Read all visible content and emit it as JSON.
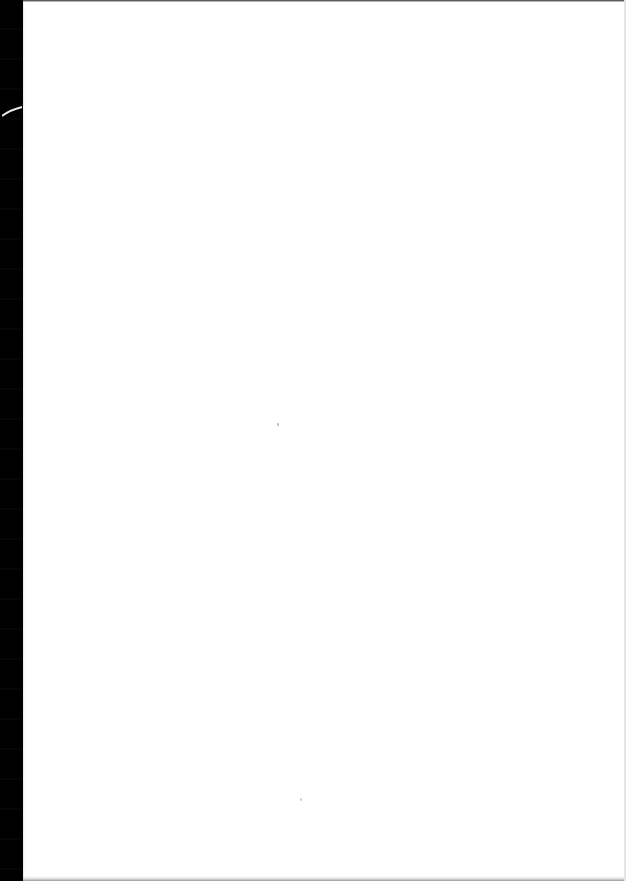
{
  "document": {
    "type": "scanned-page",
    "content": "",
    "colors": {
      "paper": "#ffffff",
      "scanner_background": "#000000",
      "edge_shadow": "#9a9a9a"
    }
  }
}
